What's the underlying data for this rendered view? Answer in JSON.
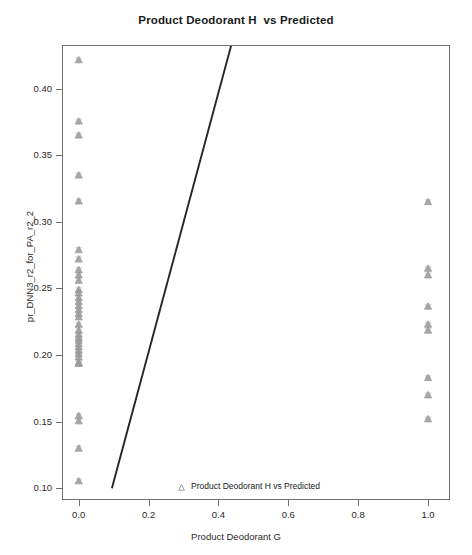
{
  "chart_data": {
    "type": "scatter",
    "title": "Product Deodorant H  vs Predicted",
    "xlabel": "Product Deodorant G",
    "ylabel": "pr_DNN3_r2_for_PA_r2_2",
    "xlim": [
      -0.045,
      1.06
    ],
    "ylim": [
      0.092,
      0.432
    ],
    "xticks": [
      0.0,
      0.2,
      0.4,
      0.6,
      0.8,
      1.0
    ],
    "xtick_labels": [
      "0.0",
      "0.2",
      "0.4",
      "0.6",
      "0.8",
      "1.0"
    ],
    "yticks": [
      0.1,
      0.15,
      0.2,
      0.25,
      0.3,
      0.35,
      0.4
    ],
    "ytick_labels": [
      "0.10",
      "0.15",
      "0.20",
      "0.25",
      "0.30",
      "0.35",
      "0.40"
    ],
    "grid": false,
    "legend_position": "bottom-center",
    "series": [
      {
        "name": "Product Deodorant H vs Predicted",
        "marker": "triangle",
        "color": "#9a9a9a",
        "points": [
          [
            0.0,
            0.4215
          ],
          [
            0.0,
            0.3755
          ],
          [
            0.0,
            0.365
          ],
          [
            0.0,
            0.335
          ],
          [
            0.0,
            0.3155
          ],
          [
            0.0,
            0.279
          ],
          [
            0.0,
            0.272
          ],
          [
            0.0,
            0.264
          ],
          [
            0.0,
            0.26
          ],
          [
            0.0,
            0.256
          ],
          [
            0.0,
            0.249
          ],
          [
            0.0,
            0.2465
          ],
          [
            0.0,
            0.243
          ],
          [
            0.0,
            0.24
          ],
          [
            0.0,
            0.237
          ],
          [
            0.0,
            0.234
          ],
          [
            0.0,
            0.231
          ],
          [
            0.0,
            0.2285
          ],
          [
            0.0,
            0.223
          ],
          [
            0.0,
            0.2185
          ],
          [
            0.0,
            0.2155
          ],
          [
            0.0,
            0.213
          ],
          [
            0.0,
            0.211
          ],
          [
            0.0,
            0.2085
          ],
          [
            0.0,
            0.206
          ],
          [
            0.0,
            0.2035
          ],
          [
            0.0,
            0.201
          ],
          [
            0.0,
            0.1985
          ],
          [
            0.0,
            0.1945
          ],
          [
            0.0,
            0.1935
          ],
          [
            0.0,
            0.1545
          ],
          [
            0.0,
            0.1505
          ],
          [
            0.0,
            0.13
          ],
          [
            0.0,
            0.1055
          ],
          [
            1.0,
            0.315
          ],
          [
            1.0,
            0.265
          ],
          [
            1.0,
            0.26
          ],
          [
            1.0,
            0.2365
          ],
          [
            1.0,
            0.223
          ],
          [
            1.0,
            0.2185
          ],
          [
            1.0,
            0.183
          ],
          [
            1.0,
            0.17
          ],
          [
            1.0,
            0.152
          ]
        ]
      }
    ],
    "fit_line": {
      "name": "regression-line",
      "color": "#262626",
      "x_start": 0.095,
      "y_start": 0.1,
      "x_end": 0.437,
      "y_end": 0.433
    }
  }
}
